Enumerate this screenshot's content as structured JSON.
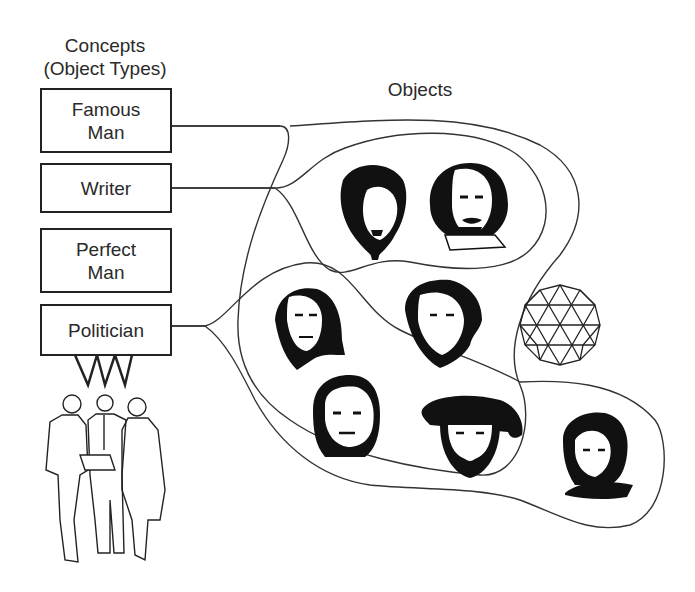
{
  "headings": {
    "concepts_line1": "Concepts",
    "concepts_line2": "(Object Types)",
    "objects": "Objects"
  },
  "concepts": [
    {
      "label_line1": "Famous",
      "label_line2": "Man"
    },
    {
      "label_line1": "Writer",
      "label_line2": ""
    },
    {
      "label_line1": "Perfect",
      "label_line2": "Man"
    },
    {
      "label_line1": "Politician",
      "label_line2": ""
    }
  ],
  "objects": [
    {
      "name": "portrait-writer-1",
      "icon": "portrait-icon",
      "sets": [
        "Famous Man",
        "Writer"
      ]
    },
    {
      "name": "portrait-writer-2-shakespeare",
      "icon": "portrait-icon",
      "sets": [
        "Famous Man",
        "Writer"
      ]
    },
    {
      "name": "portrait-politician-1-franklin",
      "icon": "portrait-icon",
      "sets": [
        "Famous Man",
        "Politician"
      ]
    },
    {
      "name": "portrait-politician-2",
      "icon": "portrait-icon",
      "sets": [
        "Famous Man",
        "Politician"
      ]
    },
    {
      "name": "portrait-politician-3-napoleon",
      "icon": "portrait-icon",
      "sets": [
        "Famous Man",
        "Politician"
      ]
    },
    {
      "name": "portrait-politician-4-henry",
      "icon": "portrait-icon",
      "sets": [
        "Famous Man",
        "Politician"
      ]
    },
    {
      "name": "portrait-politician-5-woman",
      "icon": "portrait-icon",
      "sets": [
        "Politician"
      ]
    },
    {
      "name": "geodesic-sphere",
      "icon": "geodesic-sphere-icon",
      "sets": []
    }
  ],
  "colors": {
    "line": "#333333",
    "ink": "#111111",
    "background": "#ffffff"
  }
}
